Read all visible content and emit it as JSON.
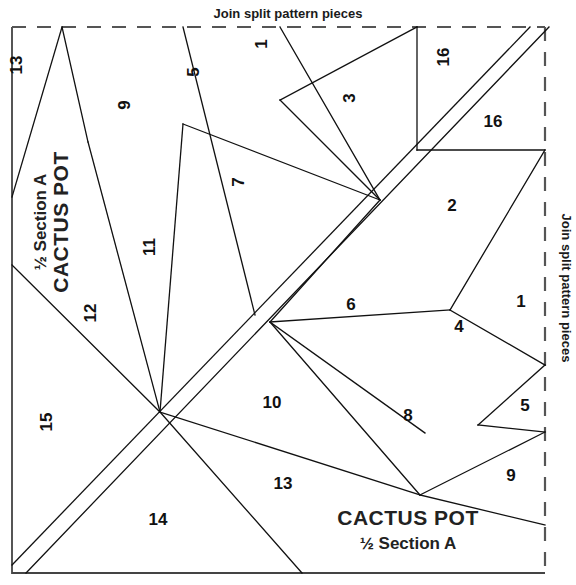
{
  "document": {
    "type": "quilt-foundation-piecing-pattern",
    "title_main": "CACTUS POT",
    "title_sub": "½ Section A",
    "title_main_rotated": "CACTUS POT",
    "title_sub_rotated": "½ Section A"
  },
  "labels": {
    "join_top": "Join split pattern pieces",
    "join_right": "Join split pattern pieces"
  },
  "pieces": [
    {
      "id": "p13a",
      "number": "13",
      "x": 22,
      "y": 65,
      "rotate": -90
    },
    {
      "id": "p9",
      "number": "9",
      "x": 130,
      "y": 105,
      "rotate": -90
    },
    {
      "id": "p5",
      "number": "5",
      "x": 199,
      "y": 72,
      "rotate": -90
    },
    {
      "id": "p1",
      "number": "1",
      "x": 267,
      "y": 44,
      "rotate": -90
    },
    {
      "id": "p3",
      "number": "3",
      "x": 355,
      "y": 98,
      "rotate": -90
    },
    {
      "id": "p16a",
      "number": "16",
      "x": 449,
      "y": 57,
      "rotate": -90
    },
    {
      "id": "p16b",
      "number": "16",
      "x": 493,
      "y": 127,
      "rotate": 0
    },
    {
      "id": "p7",
      "number": "7",
      "x": 244,
      "y": 182,
      "rotate": -90
    },
    {
      "id": "p2",
      "number": "2",
      "x": 452,
      "y": 211,
      "rotate": 0
    },
    {
      "id": "p11",
      "number": "11",
      "x": 155,
      "y": 247,
      "rotate": -90
    },
    {
      "id": "p12",
      "number": "12",
      "x": 96,
      "y": 313,
      "rotate": -90
    },
    {
      "id": "p6",
      "number": "6",
      "x": 351,
      "y": 310,
      "rotate": 0
    },
    {
      "id": "p1b",
      "number": "1",
      "x": 521,
      "y": 307,
      "rotate": 0
    },
    {
      "id": "p4",
      "number": "4",
      "x": 459,
      "y": 332,
      "rotate": 0
    },
    {
      "id": "p10",
      "number": "10",
      "x": 272,
      "y": 408,
      "rotate": 0
    },
    {
      "id": "p8",
      "number": "8",
      "x": 408,
      "y": 421,
      "rotate": 0
    },
    {
      "id": "p5b",
      "number": "5",
      "x": 525,
      "y": 411,
      "rotate": 0
    },
    {
      "id": "p15",
      "number": "15",
      "x": 52,
      "y": 422,
      "rotate": -90
    },
    {
      "id": "p13b",
      "number": "13",
      "x": 283,
      "y": 489,
      "rotate": 0
    },
    {
      "id": "p9b",
      "number": "9",
      "x": 511,
      "y": 481,
      "rotate": 0
    },
    {
      "id": "p14",
      "number": "14",
      "x": 158,
      "y": 525,
      "rotate": 0
    }
  ],
  "geometry": {
    "border_solid": "M 12,27 L 12,573 L 545,573",
    "dashed_top": "M 12,27 L 545,27",
    "dashed_right": "M 545,27 L 545,573",
    "seam_lines": [
      "M 62,27 L 12,197",
      "M 62,27 L 88,142",
      "M 88,142 L 160,412",
      "M 88,142 L 160,412",
      "M 12,265 L 160,412",
      "M 12,565 L 305,152",
      "M 26,573 L 318,168",
      "M 183,27 L 255,315",
      "M 183,124 L 380,200",
      "M 183,124 L 160,412",
      "M 280,27 L 380,200",
      "M 280,100 L 417,27",
      "M 280,100 L 380,200",
      "M 417,27 L 417,150",
      "M 417,150 L 545,150",
      "M 545,150 L 450,310",
      "M 380,200 L 270,322",
      "M 270,322 L 450,310",
      "M 270,322 L 425,433",
      "M 270,322 L 420,495",
      "M 160,412 L 420,495",
      "M 160,412 L 300,585",
      "M 450,310 L 545,365",
      "M 545,365 L 478,425",
      "M 478,425 L 545,432",
      "M 545,432 L 420,495",
      "M 420,495 L 545,525",
      "M 530,27 L 160,412",
      "M 548,27 L 173,420"
    ]
  }
}
